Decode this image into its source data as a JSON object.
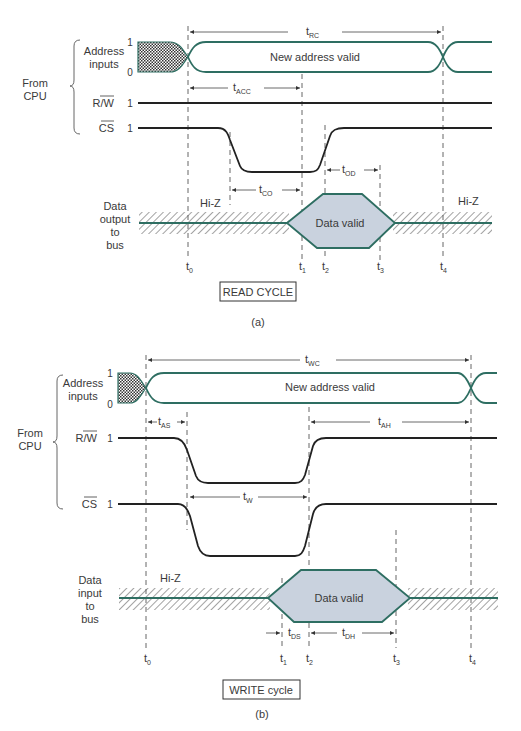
{
  "colors": {
    "address_line": "#2e6e62",
    "bus_line": "#2e6e62",
    "data_valid_fill": "#c9d2de",
    "signal_line": "#222222",
    "text": "#3a3a3a"
  },
  "read_cycle": {
    "group_label_line1": "From",
    "group_label_line2": "CPU",
    "address_label_line1": "Address",
    "address_label_line2": "inputs",
    "address_level_high": "1",
    "address_level_low": "0",
    "address_state_text": "New address valid",
    "rw_label": "R/W",
    "rw_level": "1",
    "cs_label": "CS",
    "cs_level": "1",
    "data_label_line1": "Data",
    "data_label_line2": "output",
    "data_label_line3": "to",
    "data_label_line4": "bus",
    "hiz_left": "Hi-Z",
    "hiz_right": "Hi-Z",
    "data_valid_text": "Data valid",
    "intervals": {
      "t_rc": {
        "t": "t",
        "sub": "RC"
      },
      "t_acc": {
        "t": "t",
        "sub": "ACC"
      },
      "t_co": {
        "t": "t",
        "sub": "CO"
      },
      "t_od": {
        "t": "t",
        "sub": "OD"
      }
    },
    "time_marks": [
      {
        "t": "t",
        "sub": "0"
      },
      {
        "t": "t",
        "sub": "1"
      },
      {
        "t": "t",
        "sub": "2"
      },
      {
        "t": "t",
        "sub": "3"
      },
      {
        "t": "t",
        "sub": "4"
      }
    ],
    "title_box": "READ CYCLE",
    "caption": "(a)"
  },
  "write_cycle": {
    "group_label_line1": "From",
    "group_label_line2": "CPU",
    "address_label_line1": "Address",
    "address_label_line2": "inputs",
    "address_level_high": "1",
    "address_level_low": "0",
    "address_state_text": "New address valid",
    "rw_label": "R/W",
    "rw_level": "1",
    "cs_label": "CS",
    "cs_level": "1",
    "data_label_line1": "Data",
    "data_label_line2": "input",
    "data_label_line3": "to",
    "data_label_line4": "bus",
    "hiz_left": "Hi-Z",
    "data_valid_text": "Data valid",
    "intervals": {
      "t_wc": {
        "t": "t",
        "sub": "WC"
      },
      "t_as": {
        "t": "t",
        "sub": "AS"
      },
      "t_ah": {
        "t": "t",
        "sub": "AH"
      },
      "t_w": {
        "t": "t",
        "sub": "W"
      },
      "t_ds": {
        "t": "t",
        "sub": "DS"
      },
      "t_dh": {
        "t": "t",
        "sub": "DH"
      }
    },
    "time_marks": [
      {
        "t": "t",
        "sub": "0"
      },
      {
        "t": "t",
        "sub": "1"
      },
      {
        "t": "t",
        "sub": "2"
      },
      {
        "t": "t",
        "sub": "3"
      },
      {
        "t": "t",
        "sub": "4"
      }
    ],
    "title_box": "WRITE cycle",
    "caption": "(b)"
  }
}
